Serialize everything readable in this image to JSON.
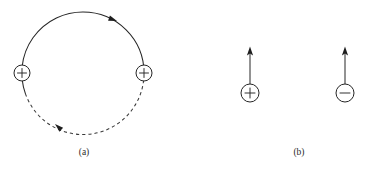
{
  "figure": {
    "background_color": "#ffffff",
    "ink_color": "#262626",
    "panels": [
      {
        "id": "a",
        "caption": "(a)",
        "caption_x": 84,
        "caption_y": 155,
        "description": "Two like (positive) charges on a circular path; solid arc with motion arrowheads and a dashed arc segment",
        "orbit": {
          "name": "circular-path",
          "center_x": 83,
          "center_y": 73,
          "radius": 61,
          "solid_arc_style": "solid",
          "dashed_arc_style": "dashed"
        },
        "charges": [
          {
            "name": "charge-left",
            "sign": "+",
            "sign_label": "+",
            "cx": 22,
            "cy": 73,
            "r": 8
          },
          {
            "name": "charge-right",
            "sign": "+",
            "sign_label": "+",
            "cx": 144,
            "cy": 73,
            "r": 8
          }
        ],
        "arrowheads": [
          {
            "name": "arrowhead-top-arc",
            "x": 116,
            "y": 22,
            "rotation_deg": 215,
            "direction": "counterclockwise"
          },
          {
            "name": "arrowhead-lower-left-arc",
            "x": 53,
            "y": 122,
            "rotation_deg": 55,
            "direction": "counterclockwise"
          }
        ]
      },
      {
        "id": "b",
        "caption": "(b)",
        "caption_x": 299,
        "caption_y": 155,
        "description": "A positive and a negative charge, each with an upward velocity vector arrow",
        "charges": [
          {
            "name": "charge-positive",
            "sign": "+",
            "sign_label": "+",
            "cx": 250,
            "cy": 93,
            "r": 9,
            "arrow": {
              "name": "velocity-arrow-positive",
              "x": 250,
              "y_tail": 84,
              "y_tip": 47,
              "direction": "up"
            }
          },
          {
            "name": "charge-negative",
            "sign": "−",
            "sign_label": "−",
            "cx": 345,
            "cy": 93,
            "r": 9,
            "arrow": {
              "name": "velocity-arrow-negative",
              "x": 345,
              "y_tail": 84,
              "y_tip": 47,
              "direction": "up"
            }
          }
        ]
      }
    ]
  }
}
